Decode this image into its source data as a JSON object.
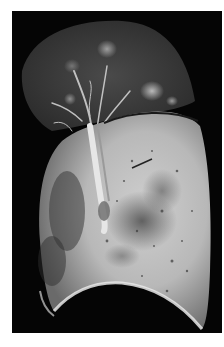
{
  "image": {
    "subject": "Gross pathology specimen: sagittal cut section of a lung on black background",
    "background_color": "#050505",
    "page_color": "#ffffff",
    "regions": [
      {
        "name": "upper-lobe",
        "description": "dark, congested upper lobe with pale nodular foci"
      },
      {
        "name": "bronchus",
        "description": "pale bronchial tree running vertically through hilum"
      },
      {
        "name": "lower-lobe",
        "description": "large pale consolidated lower lobe with mottled dark areas"
      },
      {
        "name": "pleural-surface",
        "description": "smooth pleural border along the lower edge"
      }
    ]
  }
}
